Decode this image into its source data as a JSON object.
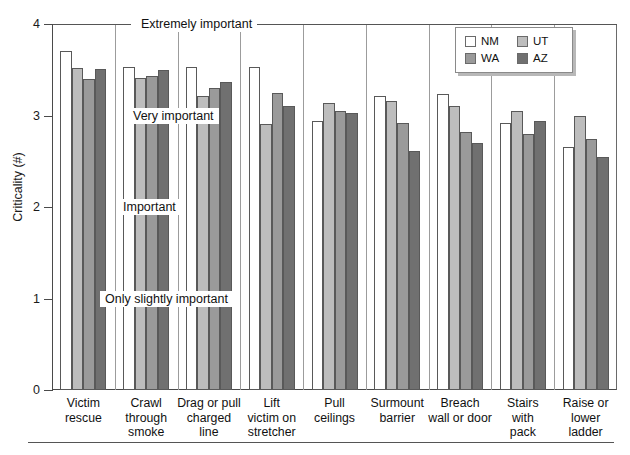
{
  "chart_data": {
    "type": "bar",
    "title": "",
    "xlabel": "",
    "ylabel": "Criticality (#)",
    "ylim": [
      0,
      4
    ],
    "yticks": [
      0,
      1,
      2,
      3,
      4
    ],
    "ytick_labels": [
      "0",
      "1",
      "2",
      "3",
      "4"
    ],
    "grid": false,
    "legend_position": "top-right",
    "categories": [
      "Victim\nrescue",
      "Crawl\nthrough\nsmoke",
      "Drag or pull\ncharged\nline",
      "Lift\nvictim on\nstretcher",
      "Pull\nceilings",
      "Surmount\nbarrier",
      "Breach\nwall or door",
      "Stairs\nwith\npack",
      "Raise or\nlower\nladder"
    ],
    "series": [
      {
        "name": "NM",
        "color": "#ffffff",
        "values": [
          3.71,
          3.53,
          3.53,
          3.53,
          2.94,
          3.21,
          3.23,
          2.92,
          2.66
        ]
      },
      {
        "name": "UT",
        "color": "#bdbdbd",
        "values": [
          3.52,
          3.41,
          3.21,
          2.91,
          3.14,
          3.16,
          3.1,
          3.05,
          3.0
        ]
      },
      {
        "name": "WA",
        "color": "#9a9a9a",
        "values": [
          3.4,
          3.43,
          3.3,
          3.25,
          3.05,
          2.92,
          2.82,
          2.8,
          2.74
        ]
      },
      {
        "name": "AZ",
        "color": "#707070",
        "values": [
          3.51,
          3.5,
          3.37,
          3.1,
          3.03,
          2.61,
          2.7,
          2.94,
          2.55
        ]
      }
    ],
    "annotations": [
      {
        "label": "Extremely important",
        "value": 4
      },
      {
        "label": "Very important",
        "value": 3
      },
      {
        "label": "Important",
        "value": 2
      },
      {
        "label": "Only slightly important",
        "value": 1
      }
    ]
  },
  "legend": {
    "entries": [
      {
        "label": "NM",
        "color": "#ffffff"
      },
      {
        "label": "UT",
        "color": "#bdbdbd"
      },
      {
        "label": "WA",
        "color": "#9a9a9a"
      },
      {
        "label": "AZ",
        "color": "#707070"
      }
    ]
  }
}
